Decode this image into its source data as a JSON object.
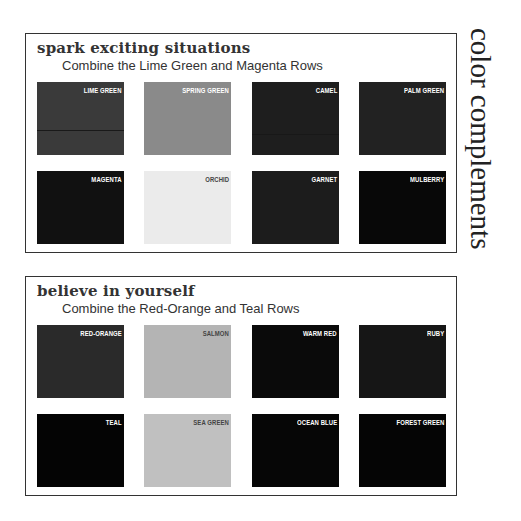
{
  "side_title": "color complements",
  "panels": [
    {
      "title": "spark exciting situations",
      "subtitle": "Combine the Lime Green and Magenta Rows",
      "swatches": [
        {
          "label": "LIME GREEN",
          "color": "#3a3a3a"
        },
        {
          "label": "SPRING GREEN",
          "color": "#8a8a8a"
        },
        {
          "label": "CAMEL",
          "color": "#1e1e1e"
        },
        {
          "label": "PALM GREEN",
          "color": "#222222"
        },
        {
          "label": "MAGENTA",
          "color": "#111111"
        },
        {
          "label": "ORCHID",
          "color": "#ebebeb"
        },
        {
          "label": "GARNET",
          "color": "#1c1c1c"
        },
        {
          "label": "MULBERRY",
          "color": "#080808"
        }
      ]
    },
    {
      "title": "believe in yourself",
      "subtitle": "Combine the Red-Orange and Teal Rows",
      "swatches": [
        {
          "label": "RED-ORANGE",
          "color": "#2a2a2a"
        },
        {
          "label": "SALMON",
          "color": "#b4b4b4"
        },
        {
          "label": "WARM RED",
          "color": "#0a0a0a"
        },
        {
          "label": "RUBY",
          "color": "#161616"
        },
        {
          "label": "TEAL",
          "color": "#040404"
        },
        {
          "label": "SEA GREEN",
          "color": "#c0c0c0"
        },
        {
          "label": "OCEAN BLUE",
          "color": "#060606"
        },
        {
          "label": "FOREST GREEN",
          "color": "#050505"
        }
      ]
    }
  ]
}
